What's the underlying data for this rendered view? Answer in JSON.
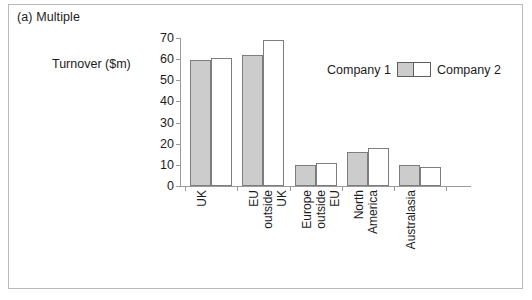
{
  "frame": {
    "border_color": "#b9b9b9"
  },
  "title": "(a) Multiple",
  "y_axis_label": "Turnover ($m)",
  "legend": {
    "series1_label": "Company 1",
    "series2_label": "Company 2",
    "series1_color": "#cccccc",
    "series2_color": "#ffffff",
    "border_color": "#5e5e5e"
  },
  "chart_data": {
    "type": "bar",
    "title": "(a) Multiple",
    "xlabel": "",
    "ylabel": "Turnover ($m)",
    "ylim": [
      0,
      70
    ],
    "yticks": [
      0,
      10,
      20,
      30,
      40,
      50,
      60,
      70
    ],
    "grid": false,
    "legend_position": "inside-right",
    "categories": [
      "UK",
      "EU outside UK",
      "Europe outside EU",
      "North America",
      "Australasia"
    ],
    "category_label_lines": [
      [
        "UK"
      ],
      [
        "EU",
        "outside",
        "UK"
      ],
      [
        "Europe",
        "outside",
        "EU"
      ],
      [
        "North",
        "America"
      ],
      [
        "Australasia"
      ]
    ],
    "series": [
      {
        "name": "Company 1",
        "color": "#cccccc",
        "values": [
          59.5,
          62,
          10,
          16,
          10
        ]
      },
      {
        "name": "Company 2",
        "color": "#ffffff",
        "values": [
          60.5,
          69,
          11,
          18,
          9
        ]
      }
    ]
  }
}
